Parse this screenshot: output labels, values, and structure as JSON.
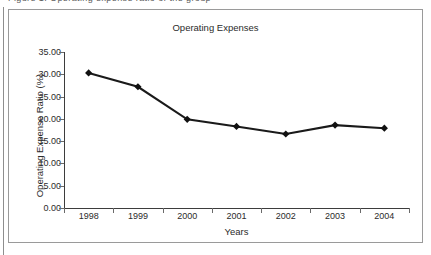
{
  "figure": {
    "caption_remnant": "Figure 1. Operating expense ratio of the group"
  },
  "chart_data": {
    "type": "line",
    "title": "Operating Expenses",
    "xlabel": "Years",
    "ylabel": "Operating Expense Ratio (%)",
    "categories": [
      "1998",
      "1999",
      "2000",
      "2001",
      "2002",
      "2003",
      "2004"
    ],
    "values": [
      30.3,
      27.2,
      19.9,
      18.3,
      16.6,
      18.6,
      17.9
    ],
    "ylim": [
      0.0,
      35.0
    ],
    "ytick_step": 5.0,
    "ytick_labels": [
      "0.00",
      "5.00",
      "10.00",
      "15.00",
      "20.00",
      "25.00",
      "30.00",
      "35.00"
    ],
    "ytick_values": [
      0,
      5,
      10,
      15,
      20,
      25,
      30,
      35
    ],
    "grid": false,
    "legend": "none",
    "marker": "diamond",
    "series_color": "#111111",
    "axis_color": "#3d3d3d",
    "frame_color": "#9a9a9a",
    "background": "#ffffff"
  }
}
